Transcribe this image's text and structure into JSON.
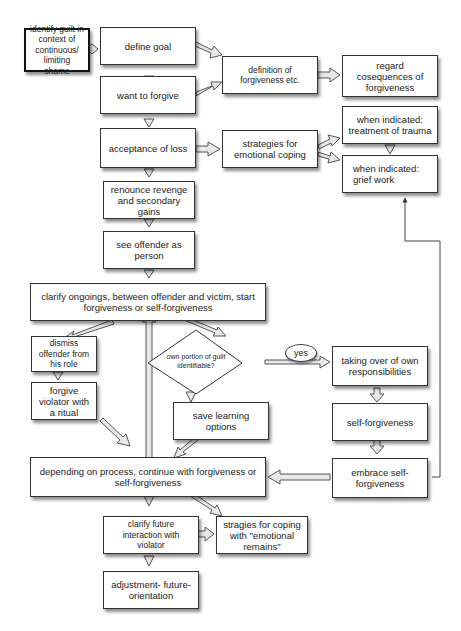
{
  "diagram": {
    "nodes": {
      "identify_guilt": "identify guilt in context of continuous/ limiting shame",
      "define_goal": "define goal",
      "want_to_forgive": "want to forgive",
      "definition_of_forgiveness": "definition of forgiveness  etc.",
      "regard_consequences": "regard cosequences of forgiveness",
      "acceptance_of_loss": "acceptance of loss",
      "strategies_emotional_coping": "strategies for emotional coping",
      "treatment_of_trauma": "when indicated: treatment of trauma",
      "grief_work": "when indicated: grief work",
      "renounce_revenge": "renounce revenge and secondary gains",
      "see_offender": "see offender as person",
      "clarify_ongoings": "clarify ongoings, between offender and victim, start forgiveness or self-forgiveness",
      "dismiss_offender": "dismiss offender from his role",
      "forgive_violator": "forgive violator with a ritual",
      "own_portion_guilt": "own portion of guilt identifiable?",
      "yes_label": "yes",
      "taking_over": "taking over of own responsibilities",
      "save_learning": "save learning options",
      "self_forgiveness": "self-forgiveness",
      "depending_on_process": "depending on process, continue with forgiveness or self-forgiveness",
      "embrace_self_forgiveness": "embrace self-forgiveness",
      "clarify_future": "clarify future interaction with violator",
      "strategies_emotional_remains": "stragies for coping with \"emotional remains\"",
      "adjustment": "adjustment- future-orientation"
    }
  }
}
